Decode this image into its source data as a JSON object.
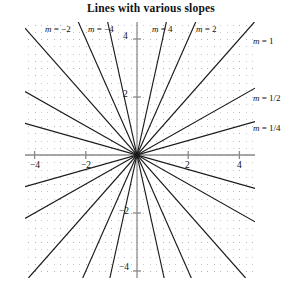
{
  "chart_data": {
    "type": "line",
    "title": "Lines with various slopes",
    "xlabel": "",
    "ylabel": "",
    "xlim": [
      -4.4,
      4.6
    ],
    "ylim": [
      -4.6,
      4.6
    ],
    "xticks": [
      -4,
      -2,
      2,
      4
    ],
    "xtick_labels": [
      "-4",
      "-2",
      "2",
      "4"
    ],
    "yticks": [
      4,
      2,
      -2,
      -4
    ],
    "ytick_labels": [
      "4",
      "2",
      "-2",
      "-4"
    ],
    "grid": true,
    "grid_style": "dotted",
    "legend": "inline-annotations",
    "series": [
      {
        "name": "m = -4",
        "slope": -4,
        "label": "m = −4",
        "intercept": 0
      },
      {
        "name": "m = -2",
        "slope": -2,
        "label": "m = −2",
        "intercept": 0
      },
      {
        "name": "m = -1",
        "slope": -1,
        "label": "",
        "intercept": 0
      },
      {
        "name": "m = -1/2",
        "slope": -0.5,
        "label": "",
        "intercept": 0
      },
      {
        "name": "m = -1/4",
        "slope": -0.25,
        "label": "",
        "intercept": 0
      },
      {
        "name": "m = 1/4",
        "slope": 0.25,
        "label": "m = 1/4",
        "intercept": 0
      },
      {
        "name": "m = 1/2",
        "slope": 0.5,
        "label": "m = 1/2",
        "intercept": 0
      },
      {
        "name": "m = 1",
        "slope": 1,
        "label": "m = 1",
        "intercept": 0
      },
      {
        "name": "m = 2",
        "slope": 2,
        "label": "m = 2",
        "intercept": 0
      },
      {
        "name": "m = 4",
        "slope": 4,
        "label": "m = 4",
        "intercept": 0
      }
    ]
  },
  "figure": {
    "title": "Lines with various slopes",
    "annotations": [
      {
        "id": "m-neg-2",
        "text_m": "m",
        "text_rest": "= −2",
        "x": 45,
        "y": 24
      },
      {
        "id": "m-neg-4",
        "text_m": "m",
        "text_rest": "= −4",
        "x": 88,
        "y": 24
      },
      {
        "id": "m-pos-4",
        "text_m": "m",
        "text_rest": "= 4",
        "x": 152,
        "y": 24
      },
      {
        "id": "m-pos-2",
        "text_m": "m",
        "text_rest": "= 2",
        "x": 196,
        "y": 24
      },
      {
        "id": "m-pos-1",
        "text_m": "m",
        "text_rest": "= 1",
        "x": 253,
        "y": 36
      },
      {
        "id": "m-half",
        "text_m": "m",
        "text_rest": "= 1/2",
        "x": 253,
        "y": 93
      },
      {
        "id": "m-quarter",
        "text_m": "m",
        "text_rest": "= 1/4",
        "x": 253,
        "y": 123
      }
    ],
    "xtick_labels": [
      {
        "text": "−4",
        "x": 30,
        "y": 160
      },
      {
        "text": "−2",
        "x": 81,
        "y": 160
      },
      {
        "text": "2",
        "x": 185,
        "y": 160
      },
      {
        "text": "4",
        "x": 237,
        "y": 160
      }
    ],
    "ytick_labels": [
      {
        "text": "4",
        "x": 123,
        "y": 31
      },
      {
        "text": "2",
        "x": 123,
        "y": 89
      },
      {
        "text": "−2",
        "x": 119,
        "y": 206
      },
      {
        "text": "−4",
        "x": 119,
        "y": 262
      }
    ],
    "colors": {
      "line": "#1a1a1a",
      "axis": "#8a8a8a",
      "grid_dot": "#c9c9d6",
      "grid_dot_major": "#b0b0c0",
      "background": "#ffffff",
      "text": "#111111"
    }
  }
}
